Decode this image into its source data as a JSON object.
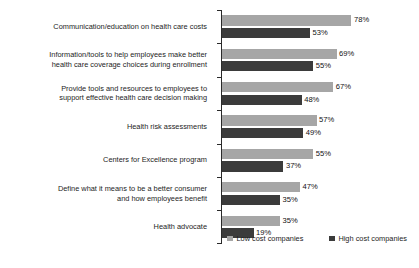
{
  "chart_data": {
    "type": "bar",
    "orientation": "horizontal",
    "title": "",
    "subtitle": "",
    "xlabel": "",
    "ylabel": "",
    "xlim": [
      0,
      100
    ],
    "grid": false,
    "legend_position": "bottom-right",
    "value_suffix": "%",
    "categories": [
      "Communication/education on health care costs",
      "Information/tools to help employees make better\nhealth care coverage choices during enrollment",
      "Provide tools and resources to employees to\nsupport effective health care decision making",
      "Health risk assessments",
      "Centers for Excellence program",
      "Define what it means to be a better consumer\nand how employees benefit",
      "Health advocate"
    ],
    "series": [
      {
        "name": "Low cost companies",
        "color": "#a6a6a6",
        "values": [
          78,
          69,
          67,
          57,
          55,
          47,
          35
        ],
        "labels": [
          "78%",
          "69%",
          "67%",
          "57%",
          "55%",
          "47%",
          "35%"
        ]
      },
      {
        "name": "High cost companies",
        "color": "#3b3b3b",
        "values": [
          53,
          55,
          48,
          49,
          37,
          35,
          19
        ],
        "labels": [
          "53%",
          "55%",
          "48%",
          "49%",
          "37%",
          "35%",
          "19%"
        ]
      }
    ]
  },
  "legend": {
    "items": [
      {
        "label": "Low cost companies",
        "color": "#a6a6a6"
      },
      {
        "label": "High cost companies",
        "color": "#3b3b3b"
      }
    ]
  }
}
